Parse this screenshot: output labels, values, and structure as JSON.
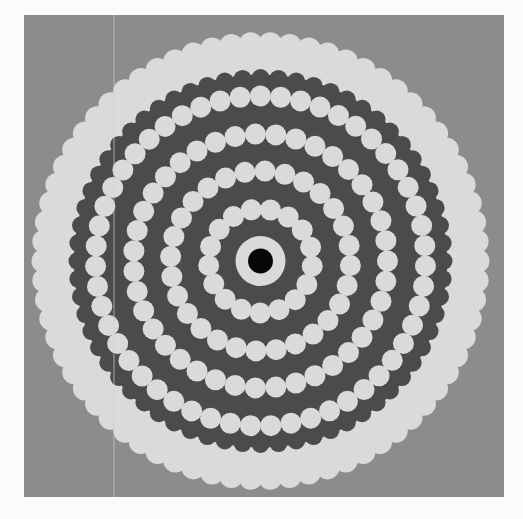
{
  "figure": {
    "canvas": {
      "width": 523,
      "height": 519,
      "background": "#fbfbfb"
    },
    "frame": {
      "x": 24,
      "y": 15,
      "width": 480,
      "height": 482,
      "color": "#8c8c8c"
    },
    "scan_line": {
      "x": 114,
      "y1": 15,
      "y2": 497,
      "color": "#cfcfcf"
    },
    "center": {
      "x": 260.5,
      "y": 261
    },
    "colors": {
      "light": "#dadada",
      "dark": "#4b4b4b",
      "core": "#080808",
      "gray": "#8c8c8c"
    },
    "outer_light_disc": {
      "radius": 229,
      "scallop_bead_radius": 12,
      "scallop_count": 70
    },
    "dark_disc": {
      "radius": 192,
      "scallop_bead_radius": 9,
      "scallop_count": 64
    },
    "inner_light_ring": {
      "radius": 25
    },
    "core_disc": {
      "radius": 12.5
    },
    "bead_rings": [
      {
        "radius": 52,
        "bead_radius": 10.5,
        "count": 17,
        "phase": 0.1
      },
      {
        "radius": 90,
        "bead_radius": 10.5,
        "count": 28,
        "phase": 0.05
      },
      {
        "radius": 127,
        "bead_radius": 10.5,
        "count": 39,
        "phase": 0.0
      },
      {
        "radius": 165,
        "bead_radius": 10.5,
        "count": 51,
        "phase": 0.03
      }
    ]
  }
}
